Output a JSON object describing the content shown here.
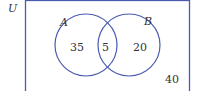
{
  "diagram": {
    "type": "venn",
    "universe_label": "U",
    "sets": [
      {
        "name": "A",
        "only_count": "35"
      },
      {
        "name": "B",
        "only_count": "20"
      }
    ],
    "intersection_count": "5",
    "outside_count": "40",
    "colors": {
      "line": "#4a5bb0",
      "text": "#333333"
    }
  }
}
